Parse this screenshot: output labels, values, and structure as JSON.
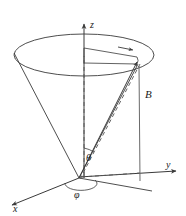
{
  "figure": {
    "background_color": "#ffffff",
    "stroke_color": "#3a3a3a",
    "text_color": "#1a1a1a",
    "axes": {
      "z": {
        "label": "z",
        "direction": "up"
      },
      "y": {
        "label": "y",
        "direction": "right"
      },
      "x": {
        "label": "x",
        "direction": "down-left"
      }
    },
    "vector": {
      "label": "B",
      "description": "field vector from origin to cone rim"
    },
    "angles": {
      "polar": {
        "label": "θ",
        "between": "z-axis and B vector"
      },
      "azimuth": {
        "label": "φ",
        "between": "x-axis and projection of B"
      }
    },
    "elements": {
      "cone": "precession cone with elliptical rim",
      "dashed_z": "dashed vertical line from origin to cone rim plane",
      "dashed_projection": "dashed line from origin to projection point in xy-plane",
      "vertical_drop": "vertical line from B tip down to xy-plane"
    }
  }
}
